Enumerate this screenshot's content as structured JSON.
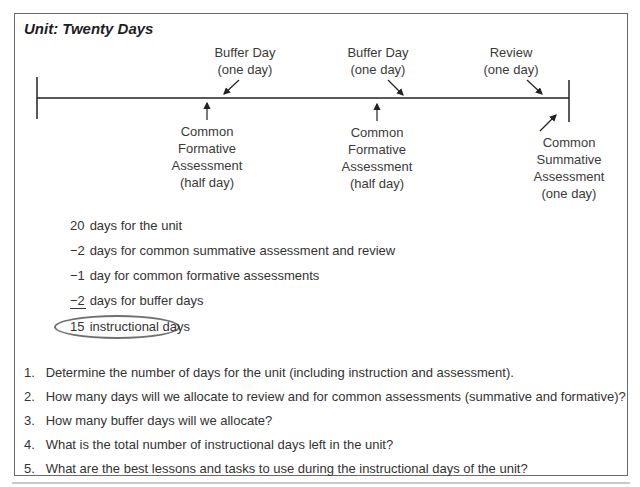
{
  "title": "Unit: Twenty Days",
  "timeline": {
    "above_labels": [
      {
        "line1": "Buffer Day",
        "line2": "(one day)"
      },
      {
        "line1": "Buffer Day",
        "line2": "(one day)"
      },
      {
        "line1": "Review",
        "line2": "(one day)"
      }
    ],
    "below_labels": [
      {
        "lines": [
          "Common",
          "Formative",
          "Assessment",
          "(half day)"
        ]
      },
      {
        "lines": [
          "Common",
          "Formative",
          "Assessment",
          "(half day)"
        ]
      },
      {
        "lines": [
          "Common",
          "Summative",
          "Assessment",
          "(one day)"
        ]
      }
    ]
  },
  "calculation": [
    {
      "num": "20",
      "text": "days for the unit"
    },
    {
      "num": "−2",
      "text": "days for common summative assessment and review"
    },
    {
      "num": "−1",
      "text": "day for common formative assessments"
    },
    {
      "num": "−2",
      "text": "days for buffer days"
    },
    {
      "num": "15",
      "text": "instructional days"
    }
  ],
  "questions": [
    {
      "n": "1.",
      "text": "Determine the number of days for the unit (including instruction and assessment)."
    },
    {
      "n": "2.",
      "text": "How many days will we allocate to review and for common assessments (summative and formative)?"
    },
    {
      "n": "3.",
      "text": "How many buffer days will we allocate?"
    },
    {
      "n": "4.",
      "text": "What is the total number of instructional days left in the unit?"
    },
    {
      "n": "5.",
      "text": "What are the best lessons and tasks to use during the instructional days of the unit?"
    }
  ]
}
